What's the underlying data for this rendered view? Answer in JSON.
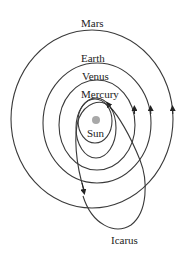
{
  "diagram": {
    "type": "orbital-diagram",
    "labels": {
      "mars": "Mars",
      "earth": "Earth",
      "venus": "Venus",
      "mercury": "Mercury",
      "sun": "Sun",
      "icarus": "Icarus"
    },
    "colors": {
      "orbit_stroke": "#3a3a3a",
      "sun_fill": "#a8a8a8",
      "text": "#222222",
      "background": "#ffffff"
    },
    "orbits": [
      {
        "name": "Inner",
        "cx": 95,
        "cy": 121,
        "rx": 17,
        "ry": 22
      },
      {
        "name": "Mercury",
        "cx": 96,
        "cy": 127,
        "rx": 20,
        "ry": 30
      },
      {
        "name": "Venus",
        "cx": 97,
        "cy": 125,
        "rx": 38,
        "ry": 45
      },
      {
        "name": "Earth",
        "cx": 97,
        "cy": 123,
        "rx": 54,
        "ry": 60
      },
      {
        "name": "Mars",
        "cx": 92,
        "cy": 118,
        "rx": 81,
        "ry": 90
      }
    ]
  }
}
